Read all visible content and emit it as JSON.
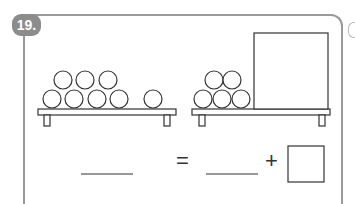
{
  "problem": {
    "number_label": "19.",
    "left_group": {
      "ball_count": 8,
      "arrangement": "5 bottom, 3 top"
    },
    "right_group": {
      "ball_count": 5,
      "arrangement": "3 bottom, 2 top",
      "hidden_box": true
    },
    "equation": {
      "equals": "=",
      "plus": "+"
    }
  },
  "colors": {
    "badge": "#8c8c8c",
    "frame": "#9a9a9a",
    "line": "#333333"
  }
}
